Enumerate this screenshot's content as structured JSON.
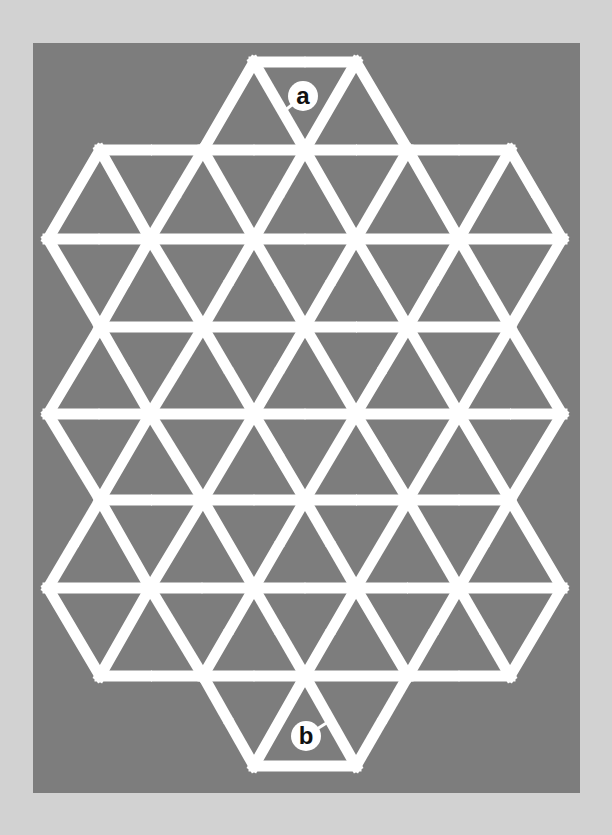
{
  "puzzle": {
    "type": "triangular-grid-maze",
    "colors": {
      "page_bg": "#d2d2d2",
      "panel_bg": "#7d7d7d",
      "path": "#ffffff",
      "label_bg": "#ffffff",
      "label_text": "#111111"
    },
    "start_label": "a",
    "end_label": "b",
    "labels": [
      {
        "text": "a",
        "cx": 303,
        "cy": 96,
        "pointer_to": [
          283,
          112
        ]
      },
      {
        "text": "b",
        "cx": 306,
        "cy": 736,
        "pointer_to": [
          328,
          722
        ]
      }
    ],
    "rows_y": [
      62,
      150,
      239,
      327,
      414,
      500,
      588,
      676,
      766
    ],
    "rows_x": [
      [
        254,
        356
      ],
      [
        100,
        203,
        305,
        408,
        510
      ],
      [
        48,
        150,
        254,
        356,
        459,
        562
      ],
      [
        100,
        203,
        305,
        408,
        510
      ],
      [
        48,
        150,
        254,
        356,
        459,
        562
      ],
      [
        100,
        203,
        305,
        408,
        510
      ],
      [
        48,
        150,
        254,
        356,
        459,
        562
      ],
      [
        100,
        203,
        305,
        408,
        510
      ],
      [
        254,
        356
      ]
    ],
    "edges": [
      {
        "a": [
          0,
          254
        ],
        "b": [
          0,
          356
        ],
        "gap": true
      },
      {
        "a": [
          0,
          254
        ],
        "b": [
          1,
          203
        ],
        "gap": false
      },
      {
        "a": [
          0,
          254
        ],
        "b": [
          1,
          305
        ],
        "gap": false
      },
      {
        "a": [
          0,
          356
        ],
        "b": [
          1,
          305
        ],
        "gap": false
      },
      {
        "a": [
          0,
          356
        ],
        "b": [
          1,
          408
        ],
        "gap": false
      },
      {
        "a": [
          1,
          100
        ],
        "b": [
          1,
          203
        ],
        "gap": true
      },
      {
        "a": [
          1,
          203
        ],
        "b": [
          1,
          305
        ],
        "gap": true
      },
      {
        "a": [
          1,
          305
        ],
        "b": [
          1,
          408
        ],
        "gap": true
      },
      {
        "a": [
          1,
          408
        ],
        "b": [
          1,
          510
        ],
        "gap": true
      },
      {
        "a": [
          1,
          100
        ],
        "b": [
          2,
          48
        ],
        "gap": false
      },
      {
        "a": [
          1,
          100
        ],
        "b": [
          2,
          150
        ],
        "gap": false
      },
      {
        "a": [
          1,
          203
        ],
        "b": [
          2,
          150
        ],
        "gap": true
      },
      {
        "a": [
          1,
          203
        ],
        "b": [
          2,
          254
        ],
        "gap": false
      },
      {
        "a": [
          1,
          305
        ],
        "b": [
          2,
          254
        ],
        "gap": true
      },
      {
        "a": [
          1,
          305
        ],
        "b": [
          2,
          356
        ],
        "gap": false
      },
      {
        "a": [
          1,
          408
        ],
        "b": [
          2,
          356
        ],
        "gap": false
      },
      {
        "a": [
          1,
          408
        ],
        "b": [
          2,
          459
        ],
        "gap": false
      },
      {
        "a": [
          1,
          510
        ],
        "b": [
          2,
          459
        ],
        "gap": false
      },
      {
        "a": [
          1,
          510
        ],
        "b": [
          2,
          562
        ],
        "gap": true
      },
      {
        "a": [
          2,
          48
        ],
        "b": [
          2,
          150
        ],
        "gap": true
      },
      {
        "a": [
          2,
          150
        ],
        "b": [
          2,
          254
        ],
        "gap": false
      },
      {
        "a": [
          2,
          254
        ],
        "b": [
          2,
          356
        ],
        "gap": true
      },
      {
        "a": [
          2,
          356
        ],
        "b": [
          2,
          459
        ],
        "gap": false
      },
      {
        "a": [
          2,
          459
        ],
        "b": [
          2,
          562
        ],
        "gap": false
      },
      {
        "a": [
          2,
          48
        ],
        "b": [
          3,
          100
        ],
        "gap": false
      },
      {
        "a": [
          2,
          150
        ],
        "b": [
          3,
          100
        ],
        "gap": true
      },
      {
        "a": [
          2,
          150
        ],
        "b": [
          3,
          203
        ],
        "gap": true
      },
      {
        "a": [
          2,
          254
        ],
        "b": [
          3,
          203
        ],
        "gap": true
      },
      {
        "a": [
          2,
          254
        ],
        "b": [
          3,
          305
        ],
        "gap": true
      },
      {
        "a": [
          2,
          356
        ],
        "b": [
          3,
          305
        ],
        "gap": true
      },
      {
        "a": [
          2,
          356
        ],
        "b": [
          3,
          408
        ],
        "gap": true
      },
      {
        "a": [
          2,
          459
        ],
        "b": [
          3,
          408
        ],
        "gap": true
      },
      {
        "a": [
          2,
          459
        ],
        "b": [
          3,
          510
        ],
        "gap": true
      },
      {
        "a": [
          2,
          562
        ],
        "b": [
          3,
          510
        ],
        "gap": false
      },
      {
        "a": [
          3,
          100
        ],
        "b": [
          3,
          203
        ],
        "gap": false
      },
      {
        "a": [
          3,
          203
        ],
        "b": [
          3,
          305
        ],
        "gap": false
      },
      {
        "a": [
          3,
          305
        ],
        "b": [
          3,
          408
        ],
        "gap": true
      },
      {
        "a": [
          3,
          408
        ],
        "b": [
          3,
          510
        ],
        "gap": false
      },
      {
        "a": [
          3,
          100
        ],
        "b": [
          4,
          48
        ],
        "gap": false
      },
      {
        "a": [
          3,
          100
        ],
        "b": [
          4,
          150
        ],
        "gap": true
      },
      {
        "a": [
          3,
          203
        ],
        "b": [
          4,
          150
        ],
        "gap": true
      },
      {
        "a": [
          3,
          203
        ],
        "b": [
          4,
          254
        ],
        "gap": true
      },
      {
        "a": [
          3,
          305
        ],
        "b": [
          4,
          254
        ],
        "gap": true
      },
      {
        "a": [
          3,
          305
        ],
        "b": [
          4,
          356
        ],
        "gap": false
      },
      {
        "a": [
          3,
          408
        ],
        "b": [
          4,
          356
        ],
        "gap": true
      },
      {
        "a": [
          3,
          408
        ],
        "b": [
          4,
          459
        ],
        "gap": false
      },
      {
        "a": [
          3,
          510
        ],
        "b": [
          4,
          459
        ],
        "gap": true
      },
      {
        "a": [
          3,
          510
        ],
        "b": [
          4,
          562
        ],
        "gap": false
      },
      {
        "a": [
          4,
          48
        ],
        "b": [
          4,
          150
        ],
        "gap": true
      },
      {
        "a": [
          4,
          150
        ],
        "b": [
          4,
          254
        ],
        "gap": false
      },
      {
        "a": [
          4,
          254
        ],
        "b": [
          4,
          356
        ],
        "gap": true
      },
      {
        "a": [
          4,
          356
        ],
        "b": [
          4,
          459
        ],
        "gap": false
      },
      {
        "a": [
          4,
          459
        ],
        "b": [
          4,
          562
        ],
        "gap": true
      },
      {
        "a": [
          4,
          48
        ],
        "b": [
          5,
          100
        ],
        "gap": false
      },
      {
        "a": [
          4,
          150
        ],
        "b": [
          5,
          100
        ],
        "gap": false
      },
      {
        "a": [
          4,
          150
        ],
        "b": [
          5,
          203
        ],
        "gap": true
      },
      {
        "a": [
          4,
          254
        ],
        "b": [
          5,
          203
        ],
        "gap": false
      },
      {
        "a": [
          4,
          254
        ],
        "b": [
          5,
          305
        ],
        "gap": true
      },
      {
        "a": [
          4,
          356
        ],
        "b": [
          5,
          305
        ],
        "gap": false
      },
      {
        "a": [
          4,
          356
        ],
        "b": [
          5,
          408
        ],
        "gap": true
      },
      {
        "a": [
          4,
          459
        ],
        "b": [
          5,
          408
        ],
        "gap": true
      },
      {
        "a": [
          4,
          459
        ],
        "b": [
          5,
          510
        ],
        "gap": true
      },
      {
        "a": [
          4,
          562
        ],
        "b": [
          5,
          510
        ],
        "gap": false
      },
      {
        "a": [
          5,
          100
        ],
        "b": [
          5,
          203
        ],
        "gap": true
      },
      {
        "a": [
          5,
          203
        ],
        "b": [
          5,
          305
        ],
        "gap": true
      },
      {
        "a": [
          5,
          305
        ],
        "b": [
          5,
          408
        ],
        "gap": true
      },
      {
        "a": [
          5,
          408
        ],
        "b": [
          5,
          510
        ],
        "gap": true
      },
      {
        "a": [
          5,
          100
        ],
        "b": [
          6,
          48
        ],
        "gap": true
      },
      {
        "a": [
          5,
          100
        ],
        "b": [
          6,
          150
        ],
        "gap": false
      },
      {
        "a": [
          5,
          203
        ],
        "b": [
          6,
          150
        ],
        "gap": false
      },
      {
        "a": [
          5,
          203
        ],
        "b": [
          6,
          254
        ],
        "gap": false
      },
      {
        "a": [
          5,
          305
        ],
        "b": [
          6,
          254
        ],
        "gap": true
      },
      {
        "a": [
          5,
          305
        ],
        "b": [
          6,
          356
        ],
        "gap": true
      },
      {
        "a": [
          5,
          408
        ],
        "b": [
          6,
          356
        ],
        "gap": false
      },
      {
        "a": [
          5,
          408
        ],
        "b": [
          6,
          459
        ],
        "gap": false
      },
      {
        "a": [
          5,
          510
        ],
        "b": [
          6,
          459
        ],
        "gap": true
      },
      {
        "a": [
          5,
          510
        ],
        "b": [
          6,
          562
        ],
        "gap": false
      },
      {
        "a": [
          6,
          48
        ],
        "b": [
          6,
          150
        ],
        "gap": false
      },
      {
        "a": [
          6,
          150
        ],
        "b": [
          6,
          254
        ],
        "gap": true
      },
      {
        "a": [
          6,
          254
        ],
        "b": [
          6,
          356
        ],
        "gap": true
      },
      {
        "a": [
          6,
          356
        ],
        "b": [
          6,
          459
        ],
        "gap": true
      },
      {
        "a": [
          6,
          459
        ],
        "b": [
          6,
          562
        ],
        "gap": false
      },
      {
        "a": [
          6,
          48
        ],
        "b": [
          7,
          100
        ],
        "gap": false
      },
      {
        "a": [
          6,
          150
        ],
        "b": [
          7,
          100
        ],
        "gap": false
      },
      {
        "a": [
          6,
          150
        ],
        "b": [
          7,
          203
        ],
        "gap": false
      },
      {
        "a": [
          6,
          254
        ],
        "b": [
          7,
          203
        ],
        "gap": true
      },
      {
        "a": [
          6,
          254
        ],
        "b": [
          7,
          305
        ],
        "gap": true
      },
      {
        "a": [
          6,
          356
        ],
        "b": [
          7,
          305
        ],
        "gap": true
      },
      {
        "a": [
          6,
          356
        ],
        "b": [
          7,
          408
        ],
        "gap": false
      },
      {
        "a": [
          6,
          459
        ],
        "b": [
          7,
          408
        ],
        "gap": true
      },
      {
        "a": [
          6,
          459
        ],
        "b": [
          7,
          510
        ],
        "gap": true
      },
      {
        "a": [
          6,
          562
        ],
        "b": [
          7,
          510
        ],
        "gap": false
      },
      {
        "a": [
          7,
          100
        ],
        "b": [
          7,
          203
        ],
        "gap": true
      },
      {
        "a": [
          7,
          203
        ],
        "b": [
          7,
          305
        ],
        "gap": true
      },
      {
        "a": [
          7,
          305
        ],
        "b": [
          7,
          408
        ],
        "gap": false
      },
      {
        "a": [
          7,
          408
        ],
        "b": [
          7,
          510
        ],
        "gap": true
      },
      {
        "a": [
          7,
          203
        ],
        "b": [
          8,
          254
        ],
        "gap": true
      },
      {
        "a": [
          7,
          305
        ],
        "b": [
          8,
          254
        ],
        "gap": false
      },
      {
        "a": [
          7,
          305
        ],
        "b": [
          8,
          356
        ],
        "gap": false
      },
      {
        "a": [
          7,
          408
        ],
        "b": [
          8,
          356
        ],
        "gap": true
      },
      {
        "a": [
          8,
          254
        ],
        "b": [
          8,
          356
        ],
        "gap": false
      }
    ]
  }
}
